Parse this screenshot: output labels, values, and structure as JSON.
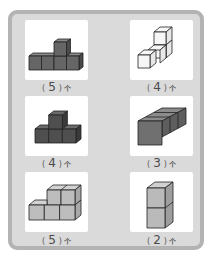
{
  "colors": {
    "frame_border": "#b3b3b3",
    "frame_fill": "#dadada",
    "tile_bg": "#ffffff",
    "cube_dark": "#5c5c5c",
    "cube_mid": "#8a8a8a",
    "cube_light": "#c4c4c4",
    "cube_white": "#f4f4f4",
    "edge": "#222222"
  },
  "items": [
    {
      "figure": "t-shape-4-base-plus-1-top",
      "answer": "5",
      "open": "(",
      "close": ")",
      "unit": "个"
    },
    {
      "figure": "staircase-white-4",
      "answer": "4",
      "open": "(",
      "close": ")",
      "unit": "个"
    },
    {
      "figure": "t-shape-3-base-plus-1-top",
      "answer": "4",
      "open": "(",
      "close": ")",
      "unit": "个"
    },
    {
      "figure": "row-of-3-depth",
      "answer": "3",
      "open": "(",
      "close": ")",
      "unit": "个"
    },
    {
      "figure": "step-3-base-plus-2-top",
      "answer": "5",
      "open": "(",
      "close": ")",
      "unit": "个"
    },
    {
      "figure": "column-of-2",
      "answer": "2",
      "open": "(",
      "close": ")",
      "unit": "个"
    }
  ]
}
